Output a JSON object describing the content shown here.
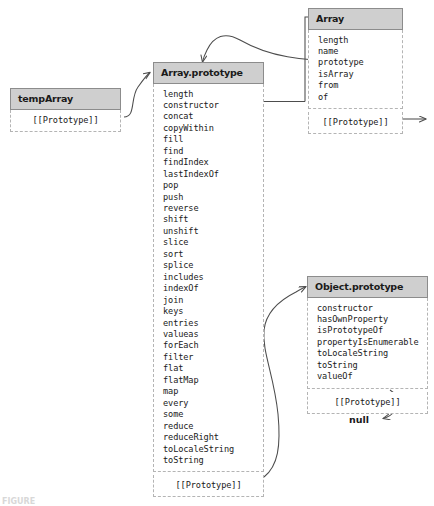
{
  "diagram": {
    "background": "#ffffff",
    "header_fill": "#cfcfcf",
    "header_border": "#8c8c8c",
    "body_border": "#b4b4b4",
    "line_color": "#4d4d4d",
    "text_color": "#1a1a1a"
  },
  "boxes": {
    "temp_array": {
      "title": "tempArray",
      "properties": [],
      "prototype_label": "[[Prototype]]"
    },
    "array_prototype": {
      "title": "Array.prototype",
      "properties": [
        "length",
        "constructor",
        "concat",
        "copyWithin",
        "fill",
        "find",
        "findIndex",
        "lastIndexOf",
        "pop",
        "push",
        "reverse",
        "shift",
        "unshift",
        "slice",
        "sort",
        "splice",
        "includes",
        "indexOf",
        "join",
        "keys",
        "entries",
        "valueas",
        "forEach",
        "filter",
        "flat",
        "flatMap",
        "map",
        "every",
        "some",
        "reduce",
        "reduceRight",
        "toLocaleString",
        "toString"
      ],
      "prototype_label": "[[Prototype]]"
    },
    "array_constructor": {
      "title": "Array",
      "properties": [
        "length",
        "name",
        "prototype",
        "isArray",
        "from",
        "of"
      ],
      "prototype_label": "[[Prototype]]"
    },
    "object_prototype": {
      "title": "Object.prototype",
      "properties": [
        "constructor",
        "hasOwnProperty",
        "isPrototypeOf",
        "propertyIsEnumerable",
        "toLocaleString",
        "toString",
        "valueOf"
      ],
      "prototype_label": "[[Prototype]]"
    }
  },
  "labels": {
    "null_terminator": "null"
  },
  "caption": {
    "text": "FIGURE"
  }
}
